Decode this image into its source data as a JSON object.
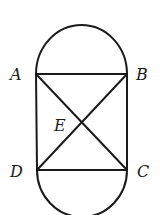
{
  "figure": {
    "points": {
      "A": {
        "label": "A",
        "x": 36,
        "y": 74
      },
      "B": {
        "label": "B",
        "x": 127,
        "y": 74
      },
      "C": {
        "label": "C",
        "x": 127,
        "y": 170
      },
      "D": {
        "label": "D",
        "x": 37,
        "y": 170
      },
      "E": {
        "label": "E",
        "x": 82,
        "y": 122
      }
    },
    "segments": [
      "AB",
      "BC",
      "CD",
      "DA",
      "AC",
      "BD"
    ],
    "arcs": [
      {
        "name": "top-semicircle",
        "from": "A",
        "to": "B",
        "diameter": "AB"
      },
      {
        "name": "bottom-semicircle",
        "from": "D",
        "to": "C",
        "diameter": "DC"
      }
    ],
    "colors": {
      "stroke": "#1a1a1a",
      "background": "#ffffff"
    }
  }
}
